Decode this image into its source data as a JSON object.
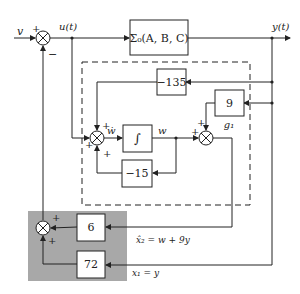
{
  "diagram": {
    "type": "block-diagram",
    "signals": {
      "input": "v",
      "control": "u(t)",
      "output": "y(t)",
      "w_dot": "ẇ",
      "w": "w",
      "x2_hat": "x̂₂ = w + 9y",
      "x1": "x₁ = y"
    },
    "blocks": {
      "plant": "Σ₀(A, B, C)",
      "gain_neg135": "−135",
      "gain_9": "9",
      "gain_9_name": "g₁",
      "integrator": "∫",
      "gain_neg15": "−15",
      "gain_6": "6",
      "gain_72": "72"
    },
    "signs": {
      "main_sum_in": "+",
      "main_sum_fb": "−",
      "obs_sum_top": "+",
      "obs_sum_left": "+",
      "obs_sum_bottom": "+",
      "out_sum_top": "+",
      "out_sum_left": "+",
      "fb_sum_top": "+",
      "fb_sum_bottom": "+"
    },
    "colors": {
      "line": "#222222",
      "feedback_region": "#a8a8a8",
      "block_fill": "#ffffff"
    }
  }
}
